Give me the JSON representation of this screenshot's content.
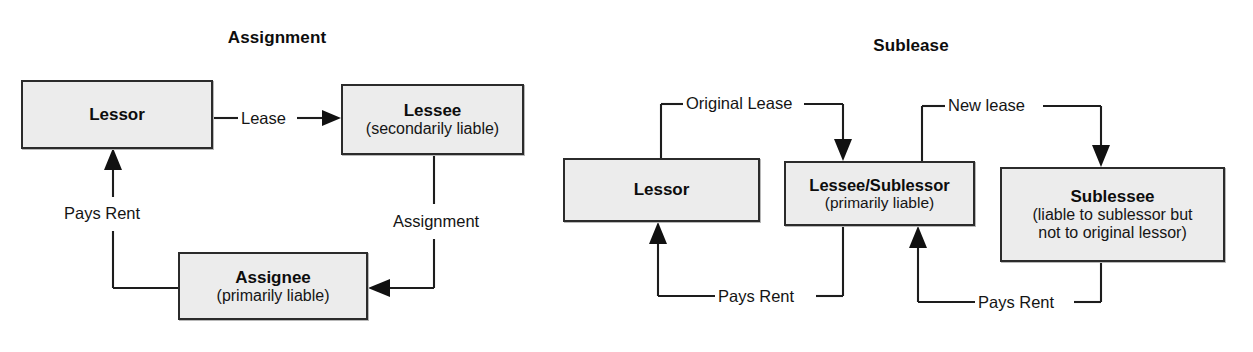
{
  "figure": {
    "kind": "diagram",
    "panels": [
      {
        "id": "assignment",
        "title": "Assignment",
        "nodes": [
          {
            "id": "lessor",
            "title": "Lessor",
            "sub": ""
          },
          {
            "id": "lessee",
            "title": "Lessee",
            "sub": "(secondarily liable)"
          },
          {
            "id": "assignee",
            "title": "Assignee",
            "sub": "(primarily liable)"
          }
        ],
        "edges": [
          {
            "id": "lease",
            "label": "Lease",
            "from": "lessor",
            "to": "lessee"
          },
          {
            "id": "assignment",
            "label": "Assignment",
            "from": "lessee",
            "to": "assignee"
          },
          {
            "id": "pays-rent",
            "label": "Pays Rent",
            "from": "assignee",
            "to": "lessor"
          }
        ]
      },
      {
        "id": "sublease",
        "title": "Sublease",
        "nodes": [
          {
            "id": "lessor2",
            "title": "Lessor",
            "sub": ""
          },
          {
            "id": "sublessor",
            "title": "Lessee/Sublessor",
            "sub": "(primarily liable)"
          },
          {
            "id": "sublessee",
            "title": "Sublessee",
            "sub_line1": "(liable to sublessor but",
            "sub_line2": "not to original lessor)"
          }
        ],
        "edges": [
          {
            "id": "original-lease",
            "label": "Original Lease",
            "from": "lessor2",
            "to": "sublessor"
          },
          {
            "id": "new-lease",
            "label": "New lease",
            "from": "sublessor",
            "to": "sublessee"
          },
          {
            "id": "pays-rent-1",
            "label": "Pays Rent",
            "from": "sublessor",
            "to": "lessor2"
          },
          {
            "id": "pays-rent-2",
            "label": "Pays Rent",
            "from": "sublessee",
            "to": "sublessor"
          }
        ]
      }
    ]
  },
  "colors": {
    "box_fill": "#ececec",
    "box_border": "#2b2b2b",
    "line": "#1d1d1d",
    "text": "#121212",
    "background": "#ffffff"
  }
}
